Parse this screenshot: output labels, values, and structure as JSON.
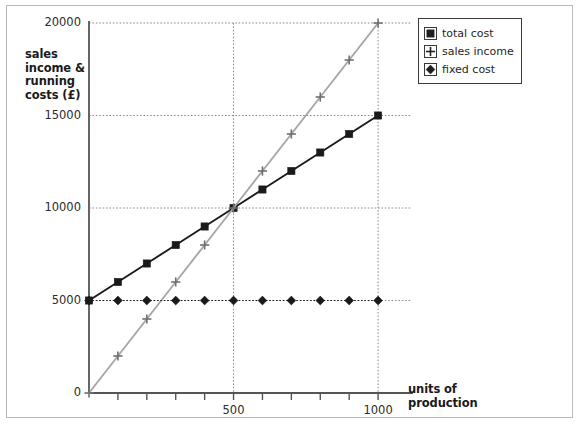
{
  "chart_data": {
    "type": "line",
    "title": "",
    "xlabel": "units of production",
    "ylabel": "sales income & running costs (£)",
    "xlim": [
      0,
      1100
    ],
    "ylim": [
      0,
      20000
    ],
    "grid": true,
    "gridlines_x": [
      500,
      1000
    ],
    "gridlines_y": [
      5000,
      10000,
      15000,
      20000
    ],
    "x_ticks": [
      100,
      200,
      300,
      400,
      500,
      600,
      700,
      800,
      900,
      1000
    ],
    "x_tick_labels": [
      "",
      "",
      "",
      "",
      "500",
      "",
      "",
      "",
      "",
      "1000"
    ],
    "y_ticks": [
      0,
      5000,
      10000,
      15000,
      20000
    ],
    "y_tick_labels": [
      "0",
      "5000",
      "10000",
      "15000",
      "20000"
    ],
    "legend_position": "top-right",
    "x": [
      0,
      100,
      200,
      300,
      400,
      500,
      600,
      700,
      800,
      900,
      1000
    ],
    "series": [
      {
        "name": "total cost",
        "marker": "square",
        "color": "#1a1a1a",
        "values": [
          5000,
          6000,
          7000,
          8000,
          9000,
          10000,
          11000,
          12000,
          13000,
          14000,
          15000
        ]
      },
      {
        "name": "sales income",
        "marker": "plus",
        "color": "#a6a6a6",
        "values": [
          0,
          2000,
          4000,
          6000,
          8000,
          10000,
          12000,
          14000,
          16000,
          18000,
          20000
        ]
      },
      {
        "name": "fixed cost",
        "marker": "diamond",
        "color": "#1a1a1a",
        "values": [
          5000,
          5000,
          5000,
          5000,
          5000,
          5000,
          5000,
          5000,
          5000,
          5000,
          5000
        ]
      }
    ]
  },
  "axes": {
    "y_title_lines": [
      "sales",
      "income &",
      "running",
      "costs (£)"
    ],
    "x_title_lines": [
      "units of",
      "production"
    ],
    "axis_color": "#555555",
    "grid_color": "#8a8a8a"
  },
  "legend": {
    "items": [
      {
        "label": "total cost",
        "marker": "square-marker-icon"
      },
      {
        "label": "sales income",
        "marker": "plus-marker-icon"
      },
      {
        "label": "fixed cost",
        "marker": "diamond-marker-icon"
      }
    ]
  },
  "frame": {
    "border_color": "#b9b9b9",
    "background": "#ffffff"
  }
}
